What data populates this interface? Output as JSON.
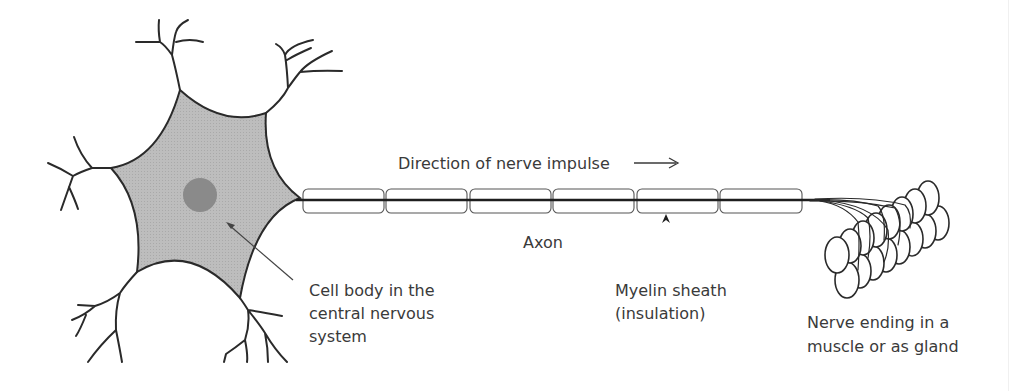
{
  "diagram": {
    "labels": {
      "direction": "Direction of nerve impulse",
      "direction_arrow": "→",
      "axon": "Axon",
      "cell_body": [
        "Cell body in the",
        "central nervous",
        "system"
      ],
      "myelin": [
        "Myelin sheath",
        "(insulation)"
      ],
      "nerve_ending": [
        "Nerve ending in a",
        "muscle or as gland"
      ]
    },
    "colors": {
      "soma_fill": "#b9b9b9",
      "nucleus_fill": "#8a8a8a",
      "line": "#2a2a2a",
      "text": "#3a3a3a",
      "background": "#ffffff"
    },
    "parts": [
      "dendrites",
      "cell body",
      "nucleus",
      "axon",
      "myelin sheath segments",
      "nerve endings",
      "muscle fibres"
    ],
    "myelin_segment_count": 6
  }
}
